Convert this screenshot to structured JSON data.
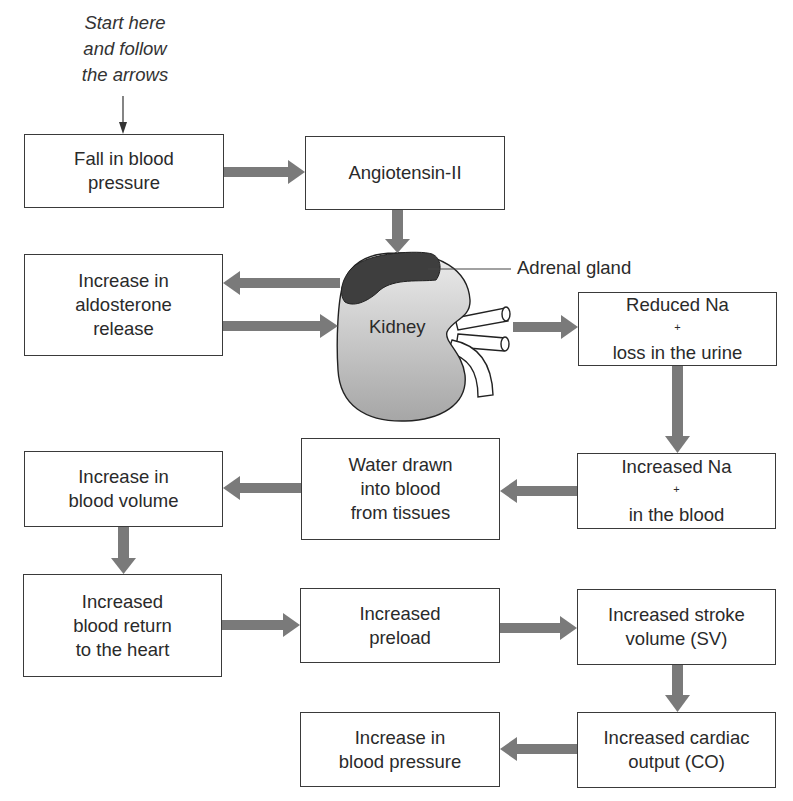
{
  "diagram": {
    "start_note": [
      "Start here",
      "and follow",
      "the arrows"
    ],
    "kidney_label": "Kidney",
    "adrenal_label": "Adrenal gland",
    "colors": {
      "arrow": "#7a7a7a",
      "box_border": "#3a3a3a",
      "adrenal_fill": "#3e3e3e",
      "kidney_fill_top": "#e6e6e6",
      "kidney_fill_bottom": "#a9a9a9"
    },
    "boxes": {
      "fall_bp": [
        "Fall in blood",
        "pressure"
      ],
      "angiotensin": [
        "Angiotensin-II"
      ],
      "aldosterone": [
        "Increase in",
        "aldosterone",
        "release"
      ],
      "reduced_na": {
        "line1": "Reduced Na",
        "sup": "+",
        "line2": "loss in the urine"
      },
      "increased_na": {
        "line1": "Increased Na",
        "sup": "+",
        "line2": "in the blood"
      },
      "water_drawn": [
        "Water drawn",
        "into blood",
        "from tissues"
      ],
      "blood_volume": [
        "Increase in",
        "blood volume"
      ],
      "blood_return": [
        "Increased",
        "blood return",
        "to the heart"
      ],
      "preload": [
        "Increased",
        "preload"
      ],
      "stroke_volume": [
        "Increased stroke",
        "volume (SV)"
      ],
      "cardiac_output": [
        "Increased cardiac",
        "output (CO)"
      ],
      "increase_bp": [
        "Increase in",
        "blood pressure"
      ]
    },
    "flow": [
      [
        "start_note",
        "fall_bp"
      ],
      [
        "fall_bp",
        "angiotensin"
      ],
      [
        "angiotensin",
        "adrenal_gland"
      ],
      [
        "adrenal_gland",
        "aldosterone"
      ],
      [
        "aldosterone",
        "kidney"
      ],
      [
        "kidney",
        "reduced_na"
      ],
      [
        "reduced_na",
        "increased_na"
      ],
      [
        "increased_na",
        "water_drawn"
      ],
      [
        "water_drawn",
        "blood_volume"
      ],
      [
        "blood_volume",
        "blood_return"
      ],
      [
        "blood_return",
        "preload"
      ],
      [
        "preload",
        "stroke_volume"
      ],
      [
        "stroke_volume",
        "cardiac_output"
      ],
      [
        "cardiac_output",
        "increase_bp"
      ]
    ]
  }
}
